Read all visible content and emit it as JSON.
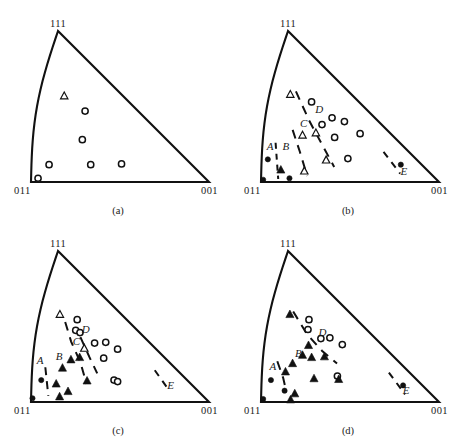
{
  "figure": {
    "type": "inverse-pole-figure-stereographic-triangle-set",
    "panel_count": 4,
    "ink_color": "#111111",
    "background_color": "#ffffff"
  },
  "corner_labels": {
    "top": "111",
    "bottom_left": "011",
    "bottom_right": "001"
  },
  "panels": [
    {
      "id": "a",
      "caption": "(a)",
      "corners": {
        "top": "111",
        "bottom_left": "011",
        "bottom_right": "001"
      },
      "region_labels": [],
      "markers": [
        {
          "type": "open-triangle",
          "x": 0.3,
          "y": 0.43
        },
        {
          "type": "open-circle",
          "x": 0.48,
          "y": 0.53
        },
        {
          "type": "open-circle",
          "x": 0.37,
          "y": 0.72
        },
        {
          "type": "open-circle",
          "x": 0.11,
          "y": 0.885
        },
        {
          "type": "open-circle",
          "x": 0.37,
          "y": 0.885
        },
        {
          "type": "open-circle",
          "x": 0.565,
          "y": 0.88
        },
        {
          "type": "open-circle",
          "x": 0.04,
          "y": 0.975
        }
      ],
      "boundaries": []
    },
    {
      "id": "b",
      "caption": "(b)",
      "corners": {
        "top": "111",
        "bottom_left": "011",
        "bottom_right": "001"
      },
      "region_labels": [
        {
          "text": "A",
          "x": 0.055,
          "y": 0.785
        },
        {
          "text": "B",
          "x": 0.165,
          "y": 0.785
        },
        {
          "text": "C",
          "x": 0.33,
          "y": 0.635
        },
        {
          "text": "D",
          "x": 0.51,
          "y": 0.545
        },
        {
          "text": "E",
          "x": 0.835,
          "y": 0.955
        }
      ],
      "markers": [
        {
          "type": "open-triangle",
          "x": 0.255,
          "y": 0.42
        },
        {
          "type": "open-circle",
          "x": 0.48,
          "y": 0.47
        },
        {
          "type": "open-circle",
          "x": 0.61,
          "y": 0.575
        },
        {
          "type": "open-circle",
          "x": 0.492,
          "y": 0.62
        },
        {
          "type": "open-circle",
          "x": 0.7,
          "y": 0.6
        },
        {
          "type": "open-triangle",
          "x": 0.305,
          "y": 0.69
        },
        {
          "type": "open-triangle",
          "x": 0.415,
          "y": 0.675
        },
        {
          "type": "open-circle",
          "x": 0.545,
          "y": 0.705
        },
        {
          "type": "open-circle",
          "x": 0.76,
          "y": 0.68
        },
        {
          "type": "open-triangle",
          "x": 0.415,
          "y": 0.855
        },
        {
          "type": "open-circle",
          "x": 0.56,
          "y": 0.845
        },
        {
          "type": "filled-circle",
          "x": 0.04,
          "y": 0.85
        },
        {
          "type": "filled-triangle",
          "x": 0.118,
          "y": 0.92
        },
        {
          "type": "filled-circle",
          "x": 0.163,
          "y": 0.975
        },
        {
          "type": "open-triangle",
          "x": 0.258,
          "y": 0.928
        },
        {
          "type": "filled-circle",
          "x": 0.87,
          "y": 0.885
        },
        {
          "type": "filled-circle",
          "x": 0.012,
          "y": 0.985
        }
      ],
      "boundaries": [
        {
          "name": "A-B",
          "dash": "6 5",
          "points": [
            [
              0.095,
              0.74
            ],
            [
              0.098,
              0.98
            ]
          ]
        },
        {
          "name": "B-C",
          "dash": "9 7",
          "points": [
            [
              0.235,
              0.655
            ],
            [
              0.258,
              0.8
            ],
            [
              0.268,
              0.96
            ]
          ]
        },
        {
          "name": "C-D",
          "dash": "9 7",
          "points": [
            [
              0.33,
              0.4
            ],
            [
              0.395,
              0.6
            ],
            [
              0.43,
              0.76
            ],
            [
              0.448,
              0.9
            ]
          ]
        },
        {
          "name": "D-E",
          "dash": "7 6",
          "points": [
            [
              0.828,
              0.8
            ],
            [
              0.82,
              0.945
            ]
          ]
        }
      ]
    },
    {
      "id": "c",
      "caption": "(c)",
      "corners": {
        "top": "111",
        "bottom_left": "011",
        "bottom_right": "001"
      },
      "region_labels": [
        {
          "text": "A",
          "x": 0.055,
          "y": 0.75
        },
        {
          "text": "B",
          "x": 0.195,
          "y": 0.725
        },
        {
          "text": "C",
          "x": 0.36,
          "y": 0.62
        },
        {
          "text": "D",
          "x": 0.48,
          "y": 0.54
        },
        {
          "text": "E",
          "x": 0.845,
          "y": 0.915
        }
      ],
      "markers": [
        {
          "type": "open-triangle",
          "x": 0.25,
          "y": 0.42
        },
        {
          "type": "open-circle",
          "x": 0.44,
          "y": 0.455
        },
        {
          "type": "open-circle",
          "x": 0.39,
          "y": 0.525
        },
        {
          "type": "open-circle",
          "x": 0.425,
          "y": 0.54
        },
        {
          "type": "open-circle",
          "x": 0.52,
          "y": 0.61
        },
        {
          "type": "open-circle",
          "x": 0.62,
          "y": 0.605
        },
        {
          "type": "open-circle",
          "x": 0.685,
          "y": 0.65
        },
        {
          "type": "open-triangle",
          "x": 0.415,
          "y": 0.645
        },
        {
          "type": "filled-triangle",
          "x": 0.285,
          "y": 0.72
        },
        {
          "type": "filled-triangle",
          "x": 0.355,
          "y": 0.705
        },
        {
          "type": "open-circle",
          "x": 0.535,
          "y": 0.71
        },
        {
          "type": "filled-triangle",
          "x": 0.212,
          "y": 0.775
        },
        {
          "type": "filled-triangle",
          "x": 0.355,
          "y": 0.86
        },
        {
          "type": "open-circle",
          "x": 0.53,
          "y": 0.855
        },
        {
          "type": "open-circle",
          "x": 0.548,
          "y": 0.865
        },
        {
          "type": "filled-circle",
          "x": 0.062,
          "y": 0.855
        },
        {
          "type": "filled-triangle",
          "x": 0.155,
          "y": 0.88
        },
        {
          "type": "filled-triangle",
          "x": 0.22,
          "y": 0.93
        },
        {
          "type": "filled-triangle",
          "x": 0.165,
          "y": 0.965
        },
        {
          "type": "filled-circle",
          "x": 0.008,
          "y": 0.975
        }
      ],
      "boundaries": [
        {
          "name": "A-B",
          "dash": "8 6",
          "points": [
            [
              0.092,
              0.77
            ],
            [
              0.1,
              0.96
            ]
          ]
        },
        {
          "name": "B-C",
          "dash": "9 7",
          "points": [
            [
              0.3,
              0.47
            ],
            [
              0.32,
              0.6
            ],
            [
              0.35,
              0.74
            ],
            [
              0.345,
              0.88
            ]
          ]
        },
        {
          "name": "C-D",
          "dash": "9 7",
          "points": [
            [
              0.415,
              0.57
            ],
            [
              0.43,
              0.7
            ],
            [
              0.44,
              0.81
            ]
          ]
        },
        {
          "name": "D-E",
          "dash": "7 6",
          "points": [
            [
              0.845,
              0.79
            ],
            [
              0.83,
              0.925
            ]
          ]
        }
      ]
    },
    {
      "id": "d",
      "caption": "(d)",
      "corners": {
        "top": "111",
        "bottom_left": "011",
        "bottom_right": "001"
      },
      "region_labels": [
        {
          "text": "A",
          "x": 0.075,
          "y": 0.79
        },
        {
          "text": "B",
          "x": 0.27,
          "y": 0.7
        },
        {
          "text": "D",
          "x": 0.53,
          "y": 0.565
        },
        {
          "text": "E",
          "x": 0.855,
          "y": 0.945
        }
      ],
      "markers": [
        {
          "type": "filled-triangle",
          "x": 0.25,
          "y": 0.42
        },
        {
          "type": "open-circle",
          "x": 0.46,
          "y": 0.455
        },
        {
          "type": "open-circle",
          "x": 0.415,
          "y": 0.52
        },
        {
          "type": "open-circle",
          "x": 0.505,
          "y": 0.58
        },
        {
          "type": "open-circle",
          "x": 0.59,
          "y": 0.575
        },
        {
          "type": "open-circle",
          "x": 0.665,
          "y": 0.62
        },
        {
          "type": "filled-triangle",
          "x": 0.375,
          "y": 0.625
        },
        {
          "type": "filled-triangle",
          "x": 0.305,
          "y": 0.69
        },
        {
          "type": "filled-triangle",
          "x": 0.37,
          "y": 0.705
        },
        {
          "type": "filled-triangle",
          "x": 0.47,
          "y": 0.7
        },
        {
          "type": "filled-triangle",
          "x": 0.218,
          "y": 0.745
        },
        {
          "type": "filled-triangle",
          "x": 0.16,
          "y": 0.8
        },
        {
          "type": "filled-triangle",
          "x": 0.34,
          "y": 0.845
        },
        {
          "type": "open-circle",
          "x": 0.5,
          "y": 0.828
        },
        {
          "type": "filled-triangle",
          "x": 0.498,
          "y": 0.85
        },
        {
          "type": "filled-circle",
          "x": 0.06,
          "y": 0.855
        },
        {
          "type": "filled-circle",
          "x": 0.14,
          "y": 0.925
        },
        {
          "type": "filled-triangle",
          "x": 0.198,
          "y": 0.945
        },
        {
          "type": "filled-triangle",
          "x": 0.168,
          "y": 0.985
        },
        {
          "type": "filled-circle",
          "x": 0.88,
          "y": 0.89
        },
        {
          "type": "filled-circle",
          "x": 0.012,
          "y": 0.98
        }
      ],
      "boundaries": [
        {
          "name": "A-B",
          "dash": "9 7",
          "points": [
            [
              0.108,
              0.73
            ],
            [
              0.14,
              0.84
            ],
            [
              0.15,
              0.935
            ]
          ]
        },
        {
          "name": "B-D",
          "dash": "9 7",
          "points": [
            [
              0.295,
              0.4
            ],
            [
              0.39,
              0.55
            ],
            [
              0.47,
              0.66
            ],
            [
              0.54,
              0.745
            ]
          ]
        },
        {
          "name": "D-E",
          "dash": "7 6",
          "points": [
            [
              0.86,
              0.805
            ],
            [
              0.845,
              0.95
            ]
          ]
        }
      ]
    }
  ]
}
